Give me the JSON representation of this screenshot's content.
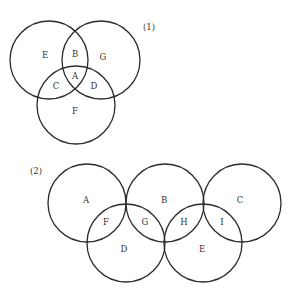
{
  "diagram1": {
    "number": "(1)",
    "circles": [
      {
        "name": "left",
        "cx": 49,
        "cy": 60,
        "r": 39
      },
      {
        "name": "right",
        "cx": 101,
        "cy": 60,
        "r": 39
      },
      {
        "name": "bottom",
        "cx": 76,
        "cy": 105,
        "r": 39
      }
    ],
    "regions": [
      {
        "label": "E",
        "x": 45,
        "y": 55
      },
      {
        "label": "B",
        "x": 75,
        "y": 54
      },
      {
        "label": "G",
        "x": 103,
        "y": 57
      },
      {
        "label": "A",
        "x": 75,
        "y": 76
      },
      {
        "label": "C",
        "x": 56,
        "y": 86
      },
      {
        "label": "D",
        "x": 94,
        "y": 86
      },
      {
        "label": "F",
        "x": 75,
        "y": 111
      }
    ]
  },
  "diagram2": {
    "number": "(2)",
    "circles": [
      {
        "name": "A-circle",
        "cx": 87,
        "cy": 203,
        "r": 39
      },
      {
        "name": "B-circle",
        "cx": 165,
        "cy": 203,
        "r": 39
      },
      {
        "name": "C-circle",
        "cx": 242,
        "cy": 203,
        "r": 39
      },
      {
        "name": "D-circle",
        "cx": 126,
        "cy": 243,
        "r": 39
      },
      {
        "name": "E-circle",
        "cx": 203,
        "cy": 243,
        "r": 39
      }
    ],
    "regions": [
      {
        "label": "A",
        "x": 86,
        "y": 200
      },
      {
        "label": "B",
        "x": 164,
        "y": 200
      },
      {
        "label": "C",
        "x": 240,
        "y": 200
      },
      {
        "label": "F",
        "x": 106,
        "y": 222
      },
      {
        "label": "G",
        "x": 145,
        "y": 222
      },
      {
        "label": "H",
        "x": 184,
        "y": 222
      },
      {
        "label": "I",
        "x": 222,
        "y": 222
      },
      {
        "label": "D",
        "x": 124,
        "y": 249
      },
      {
        "label": "E",
        "x": 202,
        "y": 249
      }
    ]
  }
}
